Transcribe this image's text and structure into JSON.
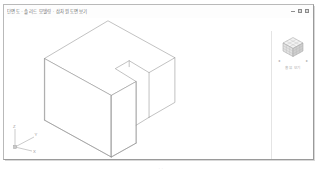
{
  "window": {
    "title": "단면도 · 솔리드 모델링 · 삼차원 도면보기",
    "controls": {
      "minimize_label": "minimize",
      "maximize_label": "maximize",
      "close_label": "close"
    }
  },
  "viewport": {
    "background_color": "#ffffff",
    "line_color": "#8c8c8c",
    "model_name": "notched-block",
    "projection": "isometric"
  },
  "nav_panel": {
    "viewcube_label": "ViewCube",
    "home_label": "홈 뷰 보기",
    "arrow_left": "◂",
    "arrow_right": "▸"
  },
  "axis_triad": {
    "z_label": "Z",
    "y_label": "Y",
    "x_label": "X",
    "origin_label": ""
  },
  "status": {
    "bottom_marker": "· ·"
  },
  "model_geometry": {
    "description": "Isometric notched rectangular block with L-shaped top face",
    "top_face": [
      [
        105,
        3
      ],
      [
        172,
        40
      ],
      [
        146,
        55
      ],
      [
        126,
        43
      ],
      [
        112,
        51
      ],
      [
        133,
        64
      ],
      [
        108,
        78
      ],
      [
        41,
        41
      ]
    ],
    "left_face": [
      [
        41,
        41
      ],
      [
        108,
        78
      ],
      [
        108,
        140
      ],
      [
        41,
        103
      ]
    ],
    "right_face": [
      [
        108,
        78
      ],
      [
        133,
        64
      ],
      [
        133,
        126
      ],
      [
        108,
        140
      ]
    ],
    "notch_riser": [
      [
        146,
        55
      ],
      [
        146,
        100
      ],
      [
        126,
        43
      ]
    ],
    "back_edges": [
      [
        172,
        40
      ],
      [
        172,
        85
      ]
    ]
  }
}
